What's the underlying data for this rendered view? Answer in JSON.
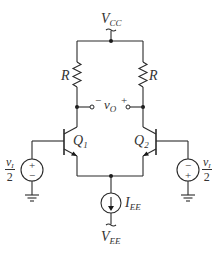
{
  "diagram": {
    "type": "BJT differential amplifier",
    "supply_top": {
      "label": "V",
      "sub": "CC"
    },
    "supply_bottom": {
      "label": "V",
      "sub": "EE"
    },
    "resistors": [
      {
        "id": "R_left",
        "label": "R"
      },
      {
        "id": "R_right",
        "label": "R"
      }
    ],
    "transistors": [
      {
        "id": "Q1",
        "label": "Q",
        "sub": "1"
      },
      {
        "id": "Q2",
        "label": "Q",
        "sub": "2"
      }
    ],
    "output": {
      "label": "v",
      "sub": "O",
      "minus": "−",
      "plus": "+"
    },
    "current_source": {
      "label": "I",
      "sub": "EE"
    },
    "sources": [
      {
        "id": "left",
        "num": "v",
        "num_sub": "I",
        "den": "2",
        "top_sign": "+",
        "bottom_sign": "−"
      },
      {
        "id": "right",
        "num": "v",
        "num_sub": "I",
        "den": "2",
        "top_sign": "−",
        "bottom_sign": "+"
      }
    ],
    "colors": {
      "wire": "#2a2a2a",
      "text": "#333333",
      "background": "#ffffff"
    }
  }
}
